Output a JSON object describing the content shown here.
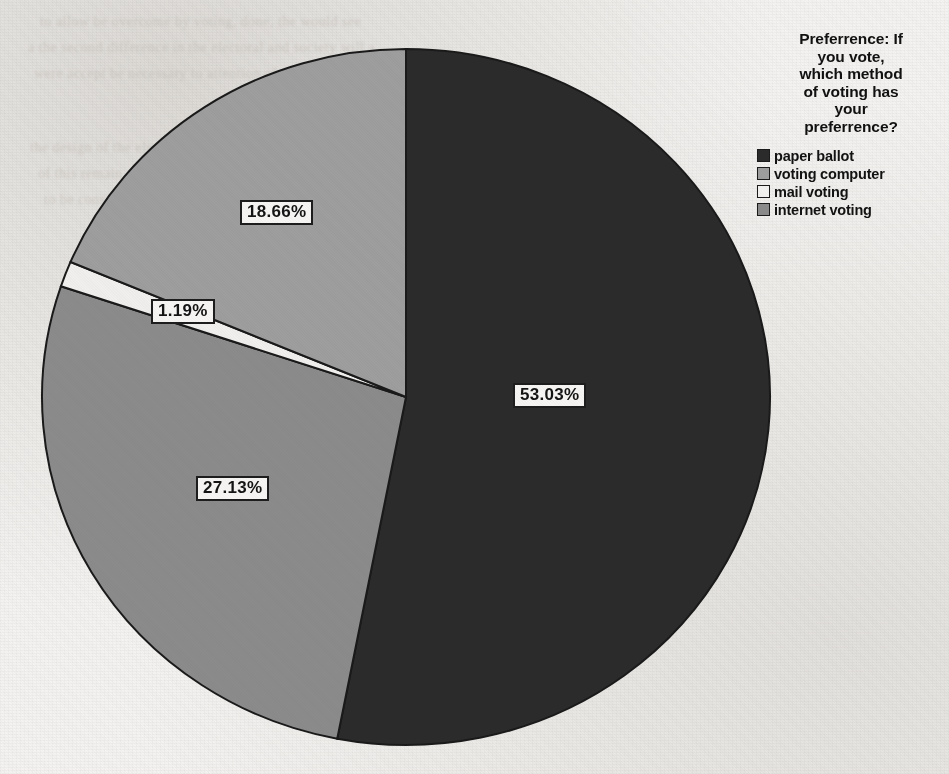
{
  "chart_data": {
    "type": "pie",
    "title_lines": [
      "Preferrence: If",
      "you vote,",
      "which method",
      "of voting has",
      "your",
      "preferrence?"
    ],
    "categories": [
      "paper ballot",
      "voting computer",
      "mail voting",
      "internet voting"
    ],
    "values": [
      53.03,
      18.66,
      1.19,
      27.13
    ],
    "value_labels": [
      "53.03%",
      "18.66%",
      "1.19%",
      "27.13%"
    ],
    "unit": "%",
    "legend_position": "right",
    "grid": false,
    "xlabel": "",
    "ylabel": "",
    "colors": [
      "#2b2b2b",
      "#9e9e9e",
      "#f0efed",
      "#8b8b8b"
    ],
    "slices": [
      {
        "label": "paper ballot",
        "value": 53.03,
        "value_label": "53.03%",
        "color": "#2b2b2b"
      },
      {
        "label": "internet voting",
        "value": 27.13,
        "value_label": "27.13%",
        "color": "#8b8b8b"
      },
      {
        "label": "mail voting",
        "value": 1.19,
        "value_label": "1.19%",
        "color": "#f0efed"
      },
      {
        "label": "voting computer",
        "value": 18.66,
        "value_label": "18.66%",
        "color": "#9e9e9e"
      }
    ]
  },
  "legend": {
    "items": [
      {
        "label": "paper ballot",
        "color": "#2b2b2b"
      },
      {
        "label": "voting computer",
        "color": "#9e9e9e"
      },
      {
        "label": "mail voting",
        "color": "#f2f1ef"
      },
      {
        "label": "internet voting",
        "color": "#8b8b8b"
      }
    ]
  },
  "labels": {
    "paper_ballot": "53.03%",
    "voting_computer": "18.66%",
    "mail_voting": "1.19%",
    "internet_voting": "27.13%"
  },
  "background": {
    "ghost_text": [
      "to allow be overcome by voting, done, the would see",
      "a the second difference in the electoral and society will a",
      "were accept be necessary to attention of the many",
      "the design of the electoral system and the decide",
      "of this remain system of for evaluating the results",
      "to be considered in an important for issue it the"
    ]
  }
}
